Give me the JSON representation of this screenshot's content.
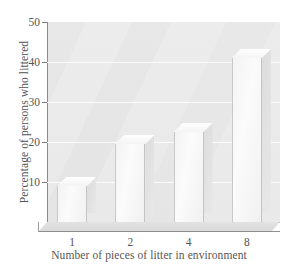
{
  "chart_data": {
    "type": "bar",
    "title": "",
    "subtitle": "",
    "xlabel": "Number of pieces of litter in environment",
    "ylabel": "Percentage of persons who littered",
    "categories": [
      "1",
      "2",
      "4",
      "8"
    ],
    "values": [
      9,
      19.5,
      22.5,
      41
    ],
    "ylim": [
      0,
      50
    ],
    "yticks": [
      10,
      20,
      30,
      40,
      50
    ],
    "ytick_labels": [
      "10",
      "20",
      "30",
      "40",
      "50"
    ],
    "grid": true,
    "grid_axis": "y",
    "legend": false,
    "legend_position": "none",
    "style": "3d-extruded-bars",
    "bar_color": "#f3f3f3",
    "plot_background": "#ececec",
    "axis_color": "#8a8a8a",
    "text_color": "#555555",
    "annotations": []
  },
  "figure": {
    "background": "#ffffff",
    "width": 298,
    "height": 268
  }
}
